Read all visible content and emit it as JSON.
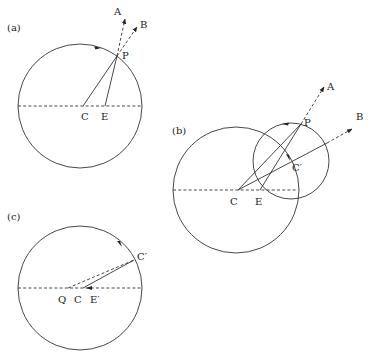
{
  "figure": {
    "panels": [
      {
        "id": "a",
        "label": "(a)",
        "points": {
          "C": "C",
          "E": "E",
          "P": "P",
          "A": "A",
          "B": "B"
        }
      },
      {
        "id": "b",
        "label": "(b)",
        "points": {
          "C": "C",
          "E": "E",
          "P": "P",
          "Cprime": "C′",
          "A": "A",
          "B": "B"
        }
      },
      {
        "id": "c",
        "label": "(c)",
        "points": {
          "Q": "Q",
          "C": "C",
          "Eprime": "E′",
          "Cprime": "C′"
        }
      }
    ],
    "colors": {
      "stroke": "#333333",
      "background": "#ffffff"
    }
  }
}
